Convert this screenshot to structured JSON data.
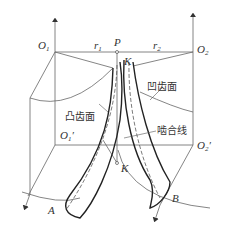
{
  "diagram": {
    "type": "gear tooth surface meshing geometry",
    "labels": {
      "O1": "O",
      "O1_sub": "1",
      "O2": "O",
      "O2_sub": "2",
      "O1p": "O",
      "O1p_sub": "1",
      "O1p_prime": "′",
      "O2p": "O",
      "O2p_sub": "2",
      "O2p_prime": "′",
      "P": "P",
      "r1": "r",
      "r1_sub": "1",
      "r2": "r",
      "r2_sub": "2",
      "K_top": "K",
      "K_bottom": "K",
      "A": "A",
      "B": "B",
      "convex_surface": "凸齿面",
      "concave_surface": "凹齿面",
      "line_of_action": "啮合线"
    },
    "colors": {
      "line": "#555555",
      "thick": "#222222",
      "text": "#333333"
    }
  }
}
